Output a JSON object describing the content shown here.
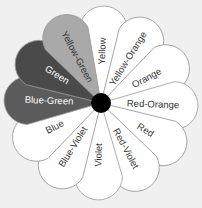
{
  "diagram": {
    "background_color": "#f0f0f0",
    "hub_color": "#000000",
    "outline_color": "#9a9a9a",
    "petals": [
      {
        "label": "Yellow",
        "fill": "#ffffff",
        "text_color": "#333333"
      },
      {
        "label": "Yellow-Orange",
        "fill": "#ffffff",
        "text_color": "#333333"
      },
      {
        "label": "Orange",
        "fill": "#ffffff",
        "text_color": "#333333"
      },
      {
        "label": "Red-Orange",
        "fill": "#ffffff",
        "text_color": "#333333"
      },
      {
        "label": "Red",
        "fill": "#ffffff",
        "text_color": "#333333"
      },
      {
        "label": "Red-Violet",
        "fill": "#ffffff",
        "text_color": "#333333"
      },
      {
        "label": "Violet",
        "fill": "#ffffff",
        "text_color": "#333333"
      },
      {
        "label": "Blue-Violet",
        "fill": "#ffffff",
        "text_color": "#333333"
      },
      {
        "label": "Blue",
        "fill": "#ffffff",
        "text_color": "#333333"
      },
      {
        "label": "Blue-Green",
        "fill": "#5b5b5b",
        "text_color": "#ffffff"
      },
      {
        "label": "Green",
        "fill": "#4a4a4a",
        "text_color": "#ffffff"
      },
      {
        "label": "Yellow-Green",
        "fill": "#a9a9a9",
        "text_color": "#333333"
      }
    ]
  }
}
